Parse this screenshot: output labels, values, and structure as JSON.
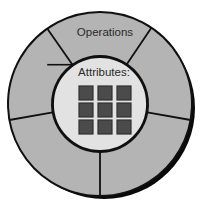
{
  "diagram": {
    "type": "concentric-ring-with-grid",
    "outer_ring": {
      "label": "Operations",
      "fill_color": "#b4b4b4",
      "stroke_color": "#101010",
      "shadow_color": "#0a0a0a",
      "center_x": 100,
      "center_y": 104,
      "outer_radius": 92,
      "inner_radius": 48,
      "sector_count": 5,
      "sector_boundary_angles_deg": [
        -125,
        -56,
        10,
        90,
        170
      ]
    },
    "inner_circle": {
      "label": "Attributes:",
      "fill_color": "#e2e2e2",
      "stroke_color": "#101010",
      "center_x": 100,
      "center_y": 104,
      "radius": 47
    },
    "attribute_grid": {
      "rows": 3,
      "columns": 3,
      "cell_fill_color": "#4b4b4b",
      "cell_stroke_color": "#2e2e2e",
      "cell_size": 14,
      "cell_gap": 5,
      "origin_x": 79,
      "origin_y": 86,
      "cells": [
        [
          {
            "name": "attribute-cell-r1c1"
          },
          {
            "name": "attribute-cell-r1c2"
          },
          {
            "name": "attribute-cell-r1c3"
          }
        ],
        [
          {
            "name": "attribute-cell-r2c1"
          },
          {
            "name": "attribute-cell-r2c2"
          },
          {
            "name": "attribute-cell-r2c3"
          }
        ],
        [
          {
            "name": "attribute-cell-r3c1"
          },
          {
            "name": "attribute-cell-r3c2"
          },
          {
            "name": "attribute-cell-r3c3"
          }
        ]
      ]
    },
    "labels": {
      "operations": {
        "text": "Operations",
        "x": 105,
        "y": 33
      },
      "attributes": {
        "text": "Attributes:",
        "x": 104,
        "y": 73
      }
    }
  }
}
